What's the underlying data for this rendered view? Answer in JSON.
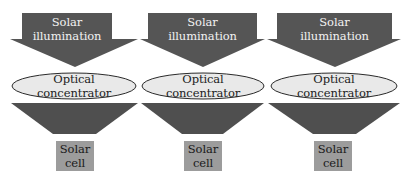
{
  "diagram": {
    "colors": {
      "arrow_fill": "#555555",
      "arrow_fill_dark": "#4a4a4a",
      "ellipse_fill": "#e9e9e9",
      "ellipse_stroke": "#2a2a2a",
      "cell_fill": "#9c9c9c",
      "background": "#ffffff"
    },
    "columns": [
      {
        "illumination": {
          "line1": "Solar",
          "line2": "illumination"
        },
        "concentrator": {
          "line1": "Optical",
          "line2": "concentrator"
        },
        "cell": {
          "line1": "Solar",
          "line2": "cell"
        }
      },
      {
        "illumination": {
          "line1": "Solar",
          "line2": "illumination"
        },
        "concentrator": {
          "line1": "Optical",
          "line2": "concentrator"
        },
        "cell": {
          "line1": "Solar",
          "line2": "cell"
        }
      },
      {
        "illumination": {
          "line1": "Solar",
          "line2": "illumination"
        },
        "concentrator": {
          "line1": "Optical",
          "line2": "concentrator"
        },
        "cell": {
          "line1": "Solar",
          "line2": "cell"
        }
      }
    ]
  }
}
